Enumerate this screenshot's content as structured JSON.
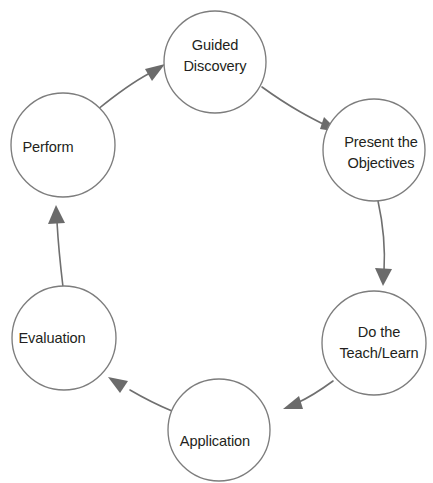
{
  "diagram": {
    "canvas": {
      "width": 433,
      "height": 483,
      "background": "#ffffff"
    },
    "style": {
      "circle_stroke": "#7d7d7d",
      "circle_fill": "#ffffff",
      "connector_stroke": "#6f6f6f",
      "arrow_fill": "#6b6b6b",
      "label_color": "#231f20"
    },
    "nodes": [
      {
        "id": "guided-discovery",
        "label_lines": [
          "Guided",
          "Discovery"
        ],
        "line1": "Guided",
        "line2": "Discovery",
        "cx": 215,
        "cy": 62,
        "r": 51,
        "position": "top"
      },
      {
        "id": "present-the-objectives",
        "label_lines": [
          "Present the",
          "Objectives"
        ],
        "line1": "Present the",
        "line2": "Objectives",
        "cx": 374,
        "cy": 150,
        "r": 51,
        "position": "upper-right"
      },
      {
        "id": "do-the-teach-learn",
        "label_lines": [
          "Do the",
          "Teach/Learn"
        ],
        "line1": "Do the",
        "line2": "Teach/Learn",
        "cx": 374,
        "cy": 343,
        "r": 52,
        "position": "lower-right"
      },
      {
        "id": "application",
        "label_lines": [
          "Application"
        ],
        "line1": "Application",
        "line2": "",
        "cx": 219,
        "cy": 430,
        "r": 51,
        "position": "bottom"
      },
      {
        "id": "evaluation",
        "label_lines": [
          "Evaluation"
        ],
        "line1": "Evaluation",
        "line2": "",
        "cx": 64,
        "cy": 338,
        "r": 52,
        "position": "lower-left"
      },
      {
        "id": "perform",
        "label_lines": [
          "Perform"
        ],
        "line1": "Perform",
        "line2": "",
        "cx": 63,
        "cy": 145,
        "r": 52,
        "position": "upper-left"
      }
    ],
    "connectors": [
      {
        "id": "guided-to-present",
        "from": "guided-discovery",
        "to": "present-the-objectives",
        "direction": "clockwise"
      },
      {
        "id": "present-to-teach",
        "from": "present-the-objectives",
        "to": "do-the-teach-learn",
        "direction": "clockwise"
      },
      {
        "id": "teach-to-application",
        "from": "do-the-teach-learn",
        "to": "application",
        "direction": "clockwise"
      },
      {
        "id": "application-to-evaluation",
        "from": "application",
        "to": "evaluation",
        "direction": "clockwise"
      },
      {
        "id": "evaluation-to-perform",
        "from": "evaluation",
        "to": "perform",
        "direction": "clockwise"
      },
      {
        "id": "perform-to-guided",
        "from": "perform",
        "to": "guided-discovery",
        "direction": "clockwise"
      }
    ]
  }
}
